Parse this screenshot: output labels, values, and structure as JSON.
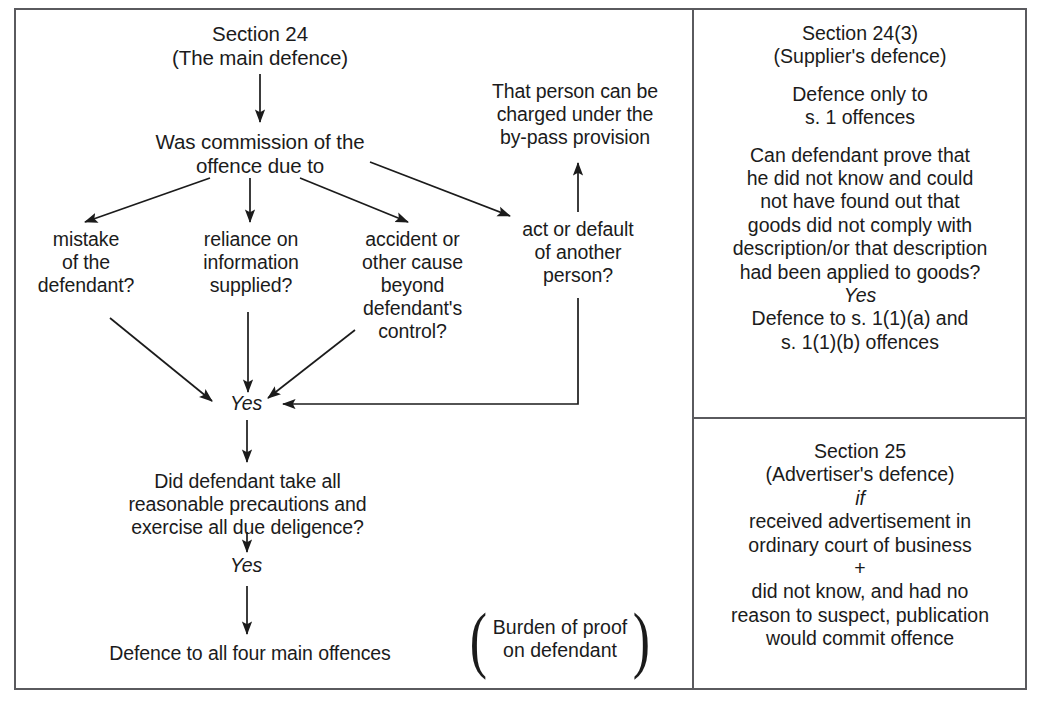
{
  "diagram": {
    "frame_color": "#5a5a5e",
    "text_color": "#1b1b1b",
    "background": "#ffffff"
  },
  "left_panel": {
    "heading": "Section 24\n(The main defence)",
    "question": "Was commission of the\noffence due to",
    "branches": [
      {
        "id": "mistake",
        "label": "mistake\nof the\ndefendant?"
      },
      {
        "id": "reliance",
        "label": "reliance on\ninformation\nsupplied?"
      },
      {
        "id": "accident",
        "label": "accident or\nother cause\nbeyond\ndefendant's\ncontrol?"
      },
      {
        "id": "act-default",
        "label": "act or default\nof another\nperson?"
      }
    ],
    "bypass": "That person can be\ncharged under the\nby-pass provision",
    "yes_1": "Yes",
    "second_question": "Did defendant take all\nreasonable precautions and\nexercise all due deligence?",
    "yes_2": "Yes",
    "outcome": "Defence to all four main offences",
    "burden": "Burden of proof\non defendant",
    "paren_open": "(",
    "paren_close": ")"
  },
  "right_panel_top": {
    "heading": "Section 24(3)\n(Supplier's defence)",
    "scope": "Defence only to\ns. 1 offences",
    "question": "Can defendant prove that\nhe did not know and could\nnot have found out that\ngoods did not comply with\ndescription/or that description\nhad been applied to goods?",
    "yes": "Yes",
    "outcome": "Defence to s. 1(1)(a) and\ns. 1(1)(b) offences"
  },
  "right_panel_bottom": {
    "heading": "Section 25\n(Advertiser's defence)",
    "conditional": "if",
    "condition_1": "received advertisement in\nordinary court of business",
    "plus": "+",
    "condition_2": "did not know, and had no\nreason to suspect, publication\nwould commit offence"
  }
}
